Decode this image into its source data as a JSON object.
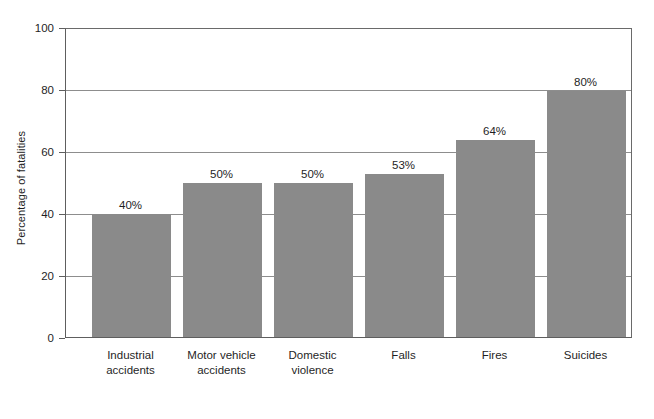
{
  "chart_data": {
    "type": "bar",
    "title": "",
    "subtitle": "",
    "xlabel": "",
    "ylabel": "Percentage of fatalities",
    "ylim": [
      0,
      100
    ],
    "yticks": [
      0,
      20,
      40,
      60,
      80,
      100
    ],
    "ytick_labels": [
      "0",
      "20",
      "40",
      "60",
      "80",
      "100"
    ],
    "grid": "horizontal",
    "legend": "none",
    "value_label_suffix": "%",
    "categories": [
      "Industrial accidents",
      "Motor vehicle accidents",
      "Domestic violence",
      "Falls",
      "Fires",
      "Suicides"
    ],
    "category_lines": [
      [
        "Industrial",
        "accidents"
      ],
      [
        "Motor vehicle",
        "accidents"
      ],
      [
        "Domestic",
        "violence"
      ],
      [
        "Falls"
      ],
      [
        "Fires"
      ],
      [
        "Suicides"
      ]
    ],
    "values": [
      40,
      50,
      50,
      53,
      64,
      80
    ],
    "value_labels": [
      "40%",
      "50%",
      "50%",
      "53%",
      "64%",
      "80%"
    ],
    "colors": {
      "bar_fill": "#8a8a8a",
      "axis_line": "#5e5e5e",
      "gridline": "#8d8d8d",
      "text": "#1f1f1f",
      "background": "#ffffff"
    }
  }
}
